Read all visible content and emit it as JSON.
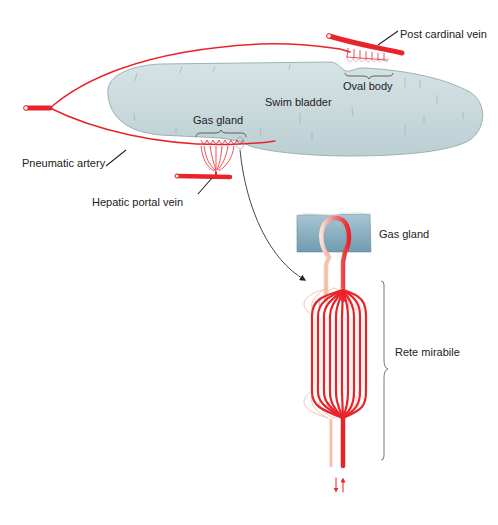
{
  "figure": {
    "type": "anatomical-diagram",
    "colors": {
      "bladder_fill": "#c9d9dc",
      "bladder_stroke": "#7f9ba1",
      "vessel_red": "#e8242a",
      "vessel_pale": "#f7c9b8",
      "gland_block": "#8fb3c4",
      "leader_line": "#222222",
      "background": "#ffffff"
    }
  },
  "labels": {
    "post_cardinal_vein": "Post cardinal vein",
    "oval_body": "Oval body",
    "swim_bladder": "Swim bladder",
    "gas_gland_top": "Gas gland",
    "pneumatic_artery": "Pneumatic artery",
    "hepatic_portal_vein": "Hepatic portal vein",
    "gas_gland_detail": "Gas gland",
    "rete_mirabile": "Rete mirabile"
  }
}
